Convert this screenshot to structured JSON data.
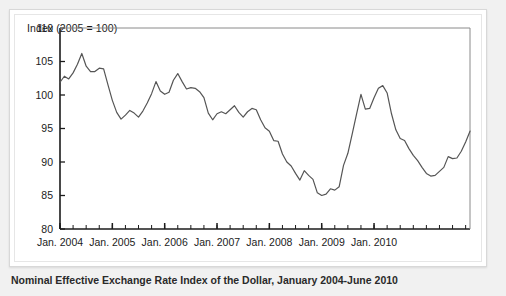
{
  "figure": {
    "axis_note": "Index (2005 = 100)",
    "caption": "Nominal Effective Exchange Rate Index of the Dollar, January 2004-June 2010",
    "line_color": "#555555",
    "axis_color": "#1b1b1b",
    "panel_background": "#ffffff",
    "page_background": "#f1f1f1"
  },
  "chart_data": {
    "type": "line",
    "title": "Nominal Effective Exchange Rate Index of the Dollar, January 2004-June 2010",
    "subtitle": "Index (2005 = 100)",
    "xlabel": "",
    "ylabel": "Index (2005 = 100)",
    "ylim": [
      80,
      110
    ],
    "yticks": [
      80,
      85,
      90,
      95,
      100,
      105,
      110
    ],
    "ytick_labels": [
      "80",
      "85",
      "90",
      "95",
      "100",
      "105",
      "110"
    ],
    "xtick_labels": [
      "Jan. 2004",
      "Jan. 2005",
      "Jan. 2006",
      "Jan. 2007",
      "Jan. 2008",
      "Jan. 2009",
      "Jan. 2010"
    ],
    "xtick_months": [
      0,
      12,
      24,
      36,
      48,
      60,
      72
    ],
    "minor_tick_interval_months": 3,
    "grid": false,
    "legend": null,
    "x_start": "2004-01",
    "x_end": "2010-06",
    "x_frequency": "monthly",
    "n_points": 78,
    "x": [
      "Jan. 2004",
      "Feb. 2004",
      "Mar. 2004",
      "Apr. 2004",
      "May 2004",
      "Jun. 2004",
      "Jul. 2004",
      "Aug. 2004",
      "Sep. 2004",
      "Oct. 2004",
      "Nov. 2004",
      "Dec. 2004",
      "Jan. 2005",
      "Feb. 2005",
      "Mar. 2005",
      "Apr. 2005",
      "May 2005",
      "Jun. 2005",
      "Jul. 2005",
      "Aug. 2005",
      "Sep. 2005",
      "Oct. 2005",
      "Nov. 2005",
      "Dec. 2005",
      "Jan. 2006",
      "Feb. 2006",
      "Mar. 2006",
      "Apr. 2006",
      "May 2006",
      "Jun. 2006",
      "Jul. 2006",
      "Aug. 2006",
      "Sep. 2006",
      "Oct. 2006",
      "Nov. 2006",
      "Dec. 2006",
      "Jan. 2007",
      "Feb. 2007",
      "Mar. 2007",
      "Apr. 2007",
      "May 2007",
      "Jun. 2007",
      "Jul. 2007",
      "Aug. 2007",
      "Sep. 2007",
      "Oct. 2007",
      "Nov. 2007",
      "Dec. 2007",
      "Jan. 2008",
      "Feb. 2008",
      "Mar. 2008",
      "Apr. 2008",
      "May 2008",
      "Jun. 2008",
      "Jul. 2008",
      "Aug. 2008",
      "Sep. 2008",
      "Oct. 2008",
      "Nov. 2008",
      "Dec. 2008",
      "Jan. 2009",
      "Feb. 2009",
      "Mar. 2009",
      "Apr. 2009",
      "May 2009",
      "Jun. 2009",
      "Jul. 2009",
      "Aug. 2009",
      "Sep. 2009",
      "Oct. 2009",
      "Nov. 2009",
      "Dec. 2009",
      "Jan. 2010",
      "Feb. 2010",
      "Mar. 2010",
      "Apr. 2010",
      "May 2010",
      "Jun. 2010"
    ],
    "values": [
      101.9,
      102.8,
      102.4,
      103.3,
      104.6,
      106.2,
      104.3,
      103.5,
      103.5,
      104.0,
      103.9,
      101.5,
      99.2,
      97.4,
      96.4,
      97.0,
      97.7,
      97.3,
      96.7,
      97.6,
      98.8,
      100.2,
      102.0,
      100.6,
      100.1,
      100.4,
      102.2,
      103.2,
      102.0,
      100.9,
      101.1,
      101.0,
      100.5,
      99.6,
      97.3,
      96.3,
      97.2,
      97.5,
      97.2,
      97.8,
      98.4,
      97.4,
      96.7,
      97.5,
      98.0,
      97.8,
      96.3,
      95.1,
      94.6,
      93.2,
      93.1,
      91.2,
      90.0,
      89.4,
      88.3,
      87.3,
      88.7,
      88.0,
      87.4,
      85.4,
      85.0,
      85.2,
      86.0,
      85.8,
      86.3,
      89.5,
      91.3,
      94.2,
      97.2,
      100.1,
      97.9,
      98.0,
      99.6,
      101.0,
      101.4,
      100.3,
      97.2,
      94.8
    ],
    "series_note": "continuation after Jun. 2010 shown through mid-2010 decline and rebound",
    "full_values": [
      101.9,
      102.8,
      102.4,
      103.3,
      104.6,
      106.2,
      104.3,
      103.5,
      103.5,
      104.0,
      103.9,
      101.5,
      99.2,
      97.4,
      96.4,
      97.0,
      97.7,
      97.3,
      96.7,
      97.6,
      98.8,
      100.2,
      102.0,
      100.6,
      100.1,
      100.4,
      102.2,
      103.2,
      102.0,
      100.9,
      101.1,
      101.0,
      100.5,
      99.6,
      97.3,
      96.3,
      97.2,
      97.5,
      97.2,
      97.8,
      98.4,
      97.4,
      96.7,
      97.5,
      98.0,
      97.8,
      96.3,
      95.1,
      94.6,
      93.2,
      93.1,
      91.2,
      90.0,
      89.4,
      88.3,
      87.3,
      88.7,
      88.0,
      87.4,
      85.4,
      85.0,
      85.2,
      86.0,
      85.8,
      86.3,
      89.5,
      91.3,
      94.2,
      97.2,
      100.1,
      97.9,
      98.0,
      99.6,
      101.0,
      101.4,
      100.3,
      97.2,
      94.8,
      93.5,
      93.2,
      92.0,
      91.0,
      90.2,
      89.2,
      88.3,
      87.9,
      88.0,
      88.6,
      89.2,
      90.8,
      90.5,
      90.6,
      91.6,
      93.0,
      94.6
    ],
    "max_value": 106.2,
    "min_value": 85.0
  }
}
